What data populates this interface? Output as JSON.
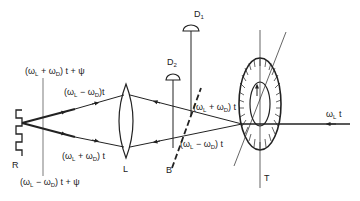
{
  "diagram": {
    "type": "optical setup schematic (laser Doppler interferometer with rotating target)",
    "colors": {
      "line": "#222222",
      "background": "#ffffff"
    },
    "components": {
      "grating_label": "R",
      "lens_label": "L",
      "beamsplitter_label": "B",
      "target_label": "T",
      "detector1_label": "D",
      "detector1_sub": "1",
      "detector2_label": "D",
      "detector2_sub": "2"
    },
    "beams": {
      "incident": "ωL t",
      "upper_to_grating": "(ωL − ωD) t",
      "lower_to_grating": "(ωL + ωD) t",
      "upper_at_target": "(ωL + ωD) t",
      "lower_at_target": "(ωL − ωD) t",
      "reflected_upper": "(ωL + ωD) t + ψ",
      "reflected_lower": "(ωL − ωD) t + ψ"
    },
    "labels": {
      "incident_omega": "ω",
      "incident_sub": "L",
      "incident_t": " t",
      "up_grating": "(ω",
      "up_grating_s1": "L",
      "up_grating_mid": " − ω",
      "up_grating_s2": "D",
      "up_grating_end": ")t",
      "low_grating": "(ω",
      "low_grating_s1": "L",
      "low_grating_mid": " + ω",
      "low_grating_s2": "D",
      "low_grating_end": ") t",
      "up_target": "(ω",
      "up_target_s1": "L",
      "up_target_mid": " + ω",
      "up_target_s2": "D",
      "up_target_end": ") t",
      "low_target": "(ω",
      "low_target_s1": "L",
      "low_target_mid": " − ω",
      "low_target_s2": "D",
      "low_target_end": ") t",
      "top_psi": "(ω",
      "top_psi_s1": "L",
      "top_psi_mid": " + ω",
      "top_psi_s2": "D",
      "top_psi_end": ") t + ψ",
      "bottom_psi": "(ω",
      "bottom_psi_s1": "L",
      "bottom_psi_mid": " − ω",
      "bottom_psi_s2": "D",
      "bottom_psi_end": ") t + ψ"
    }
  }
}
